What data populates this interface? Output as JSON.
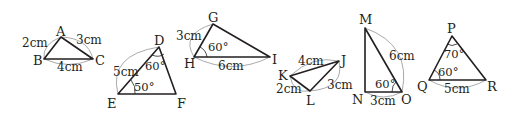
{
  "figure": {
    "triangles": [
      {
        "name": "ABC",
        "vertices": {
          "A": "A",
          "B": "B",
          "C": "C"
        },
        "sides": {
          "AB": "2cm",
          "AC": "3cm",
          "BC": "4cm"
        },
        "angles": {}
      },
      {
        "name": "DEF",
        "vertices": {
          "D": "D",
          "E": "E",
          "F": "F"
        },
        "sides": {
          "DE": "5cm"
        },
        "angles": {
          "D": "60°",
          "E": "50°"
        }
      },
      {
        "name": "GHI",
        "vertices": {
          "G": "G",
          "H": "H",
          "I": "I"
        },
        "sides": {
          "GH": "3cm",
          "HI": "6cm"
        },
        "angles": {
          "H": "60°"
        }
      },
      {
        "name": "JKL",
        "vertices": {
          "J": "J",
          "K": "K",
          "L": "L"
        },
        "sides": {
          "KJ": "4cm",
          "KL": "2cm",
          "JL": "3cm"
        },
        "angles": {}
      },
      {
        "name": "MNO",
        "vertices": {
          "M": "M",
          "N": "N",
          "O": "O"
        },
        "sides": {
          "MO": "6cm",
          "NO": "3cm"
        },
        "angles": {
          "O": "60°"
        }
      },
      {
        "name": "PQR",
        "vertices": {
          "P": "P",
          "Q": "Q",
          "R": "R"
        },
        "sides": {
          "QR": "5cm"
        },
        "angles": {
          "P": "70°",
          "Q": "60°"
        }
      }
    ]
  }
}
